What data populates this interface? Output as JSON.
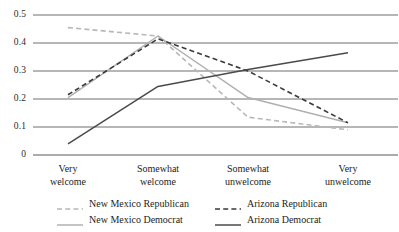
{
  "chart_data": {
    "type": "line",
    "title": "",
    "subtitle": "",
    "xlabel": "",
    "ylabel": "",
    "categories": [
      "Very welcome",
      "Somewhat welcome",
      "Somewhat unwelcome",
      "Very unwelcome"
    ],
    "category_lines": [
      [
        "Very",
        "welcome"
      ],
      [
        "Somewhat",
        "welcome"
      ],
      [
        "Somewhat",
        "unwelcome"
      ],
      [
        "Very",
        "unwelcome"
      ]
    ],
    "ylim": [
      0,
      0.5
    ],
    "yticks": [
      0,
      0.1,
      0.2,
      0.3,
      0.4,
      0.5
    ],
    "ytick_labels": [
      "0",
      "0.1",
      "0.2",
      "0.3",
      "0.4",
      "0.5"
    ],
    "grid": true,
    "grid_axis": "y",
    "legend_position": "bottom",
    "series": [
      {
        "name": "New Mexico Republican",
        "values": [
          0.455,
          0.425,
          0.135,
          0.09
        ],
        "color": "#b8b8b8",
        "style": "dashed"
      },
      {
        "name": "New Mexico Democrat",
        "values": [
          0.205,
          0.425,
          0.205,
          0.115
        ],
        "color": "#b0b0b0",
        "style": "solid"
      },
      {
        "name": "Arizona Republican",
        "values": [
          0.215,
          0.415,
          0.3,
          0.115
        ],
        "color": "#3a3a3a",
        "style": "dashed"
      },
      {
        "name": "Arizona Democrat",
        "values": [
          0.04,
          0.245,
          0.305,
          0.365
        ],
        "color": "#4a4a4a",
        "style": "solid"
      }
    ]
  },
  "legend": {
    "items": [
      {
        "label": "New Mexico Republican"
      },
      {
        "label": "New Mexico Democrat"
      },
      {
        "label": "Arizona Republican"
      },
      {
        "label": "Arizona Democrat"
      }
    ]
  }
}
